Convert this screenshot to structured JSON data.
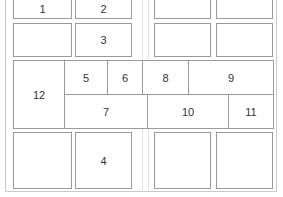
{
  "diagram": {
    "type": "layout-grid",
    "cells": [
      {
        "id": "c1",
        "label": "1"
      },
      {
        "id": "c2",
        "label": "2"
      },
      {
        "id": "c3",
        "label": "3"
      },
      {
        "id": "c4",
        "label": "4"
      },
      {
        "id": "c5",
        "label": "5"
      },
      {
        "id": "c6",
        "label": "6"
      },
      {
        "id": "c7",
        "label": "7"
      },
      {
        "id": "c8",
        "label": "8"
      },
      {
        "id": "c9",
        "label": "9"
      },
      {
        "id": "c10",
        "label": "10"
      },
      {
        "id": "c11",
        "label": "11"
      },
      {
        "id": "c12",
        "label": "12"
      }
    ],
    "colors": {
      "border": "#9a9a9a",
      "frame": "#c8c8c8",
      "text": "#333333"
    }
  }
}
